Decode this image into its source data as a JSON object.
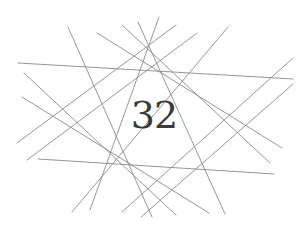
{
  "diagram": {
    "center_label": "32",
    "line_color": "#8a8a8a",
    "line_width": 0.9,
    "lines": [
      {
        "x1": 18,
        "y1": 63,
        "x2": 293,
        "y2": 79
      },
      {
        "x1": 38,
        "y1": 159,
        "x2": 274,
        "y2": 174
      },
      {
        "x1": 68,
        "y1": 27,
        "x2": 152,
        "y2": 217
      },
      {
        "x1": 228,
        "y1": 27,
        "x2": 72,
        "y2": 212
      },
      {
        "x1": 138,
        "y1": 22,
        "x2": 225,
        "y2": 214
      },
      {
        "x1": 159,
        "y1": 17,
        "x2": 90,
        "y2": 210
      },
      {
        "x1": 176,
        "y1": 25,
        "x2": 17,
        "y2": 143
      },
      {
        "x1": 197,
        "y1": 33,
        "x2": 27,
        "y2": 160
      },
      {
        "x1": 97,
        "y1": 33,
        "x2": 282,
        "y2": 148
      },
      {
        "x1": 122,
        "y1": 25,
        "x2": 270,
        "y2": 163
      },
      {
        "x1": 24,
        "y1": 73,
        "x2": 176,
        "y2": 215
      },
      {
        "x1": 22,
        "y1": 97,
        "x2": 209,
        "y2": 213
      },
      {
        "x1": 293,
        "y1": 58,
        "x2": 122,
        "y2": 212
      },
      {
        "x1": 293,
        "y1": 84,
        "x2": 141,
        "y2": 217
      }
    ]
  }
}
